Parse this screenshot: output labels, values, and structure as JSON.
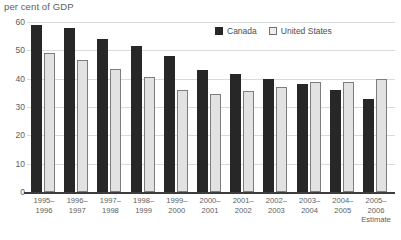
{
  "chart_data": {
    "type": "bar",
    "title": "per cent of GDP",
    "xlabel": "",
    "ylabel": "per cent of GDP",
    "ylim": [
      0,
      60
    ],
    "yticks": [
      0,
      10,
      20,
      30,
      40,
      50,
      60
    ],
    "grid": true,
    "legend_position": "top-right",
    "categories": [
      "1995–\n1996",
      "1996–\n1997",
      "1997–\n1998",
      "1998–\n1999",
      "1999–\n2000",
      "2000–\n2001",
      "2001–\n2002",
      "2002–\n2003",
      "2003–\n2004",
      "2004–\n2005",
      "2005–\n2006\nEstimate"
    ],
    "series": [
      {
        "name": "Canada",
        "color": "#272727",
        "values": [
          59,
          58,
          54,
          51.5,
          48,
          43,
          41.5,
          40,
          38,
          36,
          33
        ]
      },
      {
        "name": "United States",
        "color": "#e2e2e2",
        "values": [
          49,
          46.5,
          43.5,
          40.5,
          36,
          34.5,
          35.5,
          37,
          39,
          39,
          40
        ]
      }
    ],
    "annotations": [
      "Estimate"
    ]
  }
}
